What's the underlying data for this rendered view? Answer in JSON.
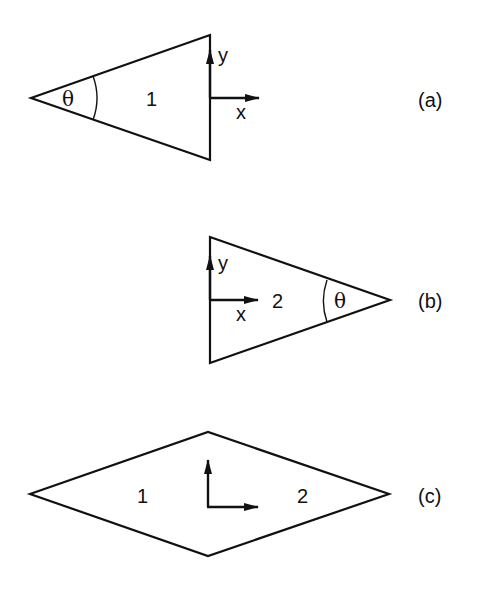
{
  "figure": {
    "panels": [
      {
        "id": "a",
        "caption": "(a)",
        "shape": "triangle",
        "region_label": "1",
        "angle_label": "θ",
        "axis_x_label": "x",
        "axis_y_label": "y"
      },
      {
        "id": "b",
        "caption": "(b)",
        "shape": "triangle",
        "region_label": "2",
        "angle_label": "θ",
        "axis_x_label": "x",
        "axis_y_label": "y"
      },
      {
        "id": "c",
        "caption": "(c)",
        "shape": "rhombus",
        "region_label_left": "1",
        "region_label_right": "2"
      }
    ],
    "stroke_color": "#111111",
    "background": "#ffffff"
  }
}
